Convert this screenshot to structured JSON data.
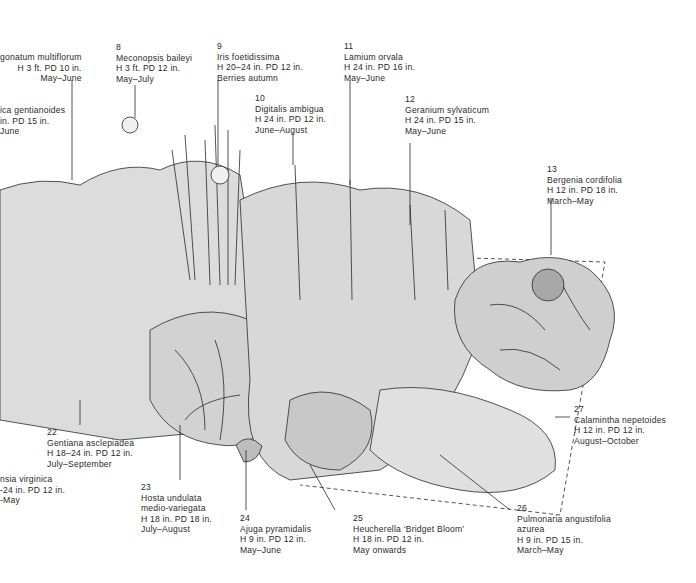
{
  "illustration": {
    "subject": "Mixed perennial border planting plan",
    "colors": {
      "ink": "#2a2a2a",
      "paper": "#ffffff",
      "leaf_fill": "#e4e4e4",
      "leaf_shade": "#bdbdbd"
    }
  },
  "labels": [
    {
      "id": "l-polygonatum",
      "num": "",
      "lines": [
        "gonatum multiflorum",
        "H 3 ft. PD 10 in.",
        "May–June"
      ]
    },
    {
      "id": "l-gentianoides",
      "num": "",
      "lines": [
        "ica gentianoides",
        "in. PD 15 in.",
        "June"
      ]
    },
    {
      "id": "l-8",
      "num": "8",
      "lines": [
        "Meconopsis baileyi",
        "H 3 ft. PD 12 in.",
        "May–July"
      ]
    },
    {
      "id": "l-9",
      "num": "9",
      "lines": [
        "Iris foetidissima",
        "H 20–24 in. PD 12 in.",
        "Berries autumn"
      ]
    },
    {
      "id": "l-10",
      "num": "10",
      "lines": [
        "Digitalis ambigua",
        "H 24 in. PD 12 in.",
        "June–August"
      ]
    },
    {
      "id": "l-11",
      "num": "11",
      "lines": [
        "Lamium orvala",
        "H 24 in. PD 16 in.",
        "May–June"
      ]
    },
    {
      "id": "l-12",
      "num": "12",
      "lines": [
        "Geranium sylvaticum",
        "H 24 in. PD 15 in.",
        "May–June"
      ]
    },
    {
      "id": "l-13",
      "num": "13",
      "lines": [
        "Bergenia cordifolia",
        "H 12 in. PD 18 in.",
        "March–May"
      ]
    },
    {
      "id": "l-22",
      "num": "22",
      "lines": [
        "Gentiana asclepiadea",
        "H 18–24 in. PD 12 in.",
        "July–September"
      ]
    },
    {
      "id": "l-virginica",
      "num": "",
      "lines": [
        "nsia virginica",
        "-24 in. PD 12 in.",
        "-May"
      ]
    },
    {
      "id": "l-23",
      "num": "23",
      "lines": [
        "Hosta undulata",
        "medio-variegata",
        "H 18 in. PD 18 in.",
        "July–August"
      ]
    },
    {
      "id": "l-24",
      "num": "24",
      "lines": [
        "Ajuga pyramidalis",
        "H 9 in. PD 12 in.",
        "May–June"
      ]
    },
    {
      "id": "l-25",
      "num": "25",
      "lines": [
        "Heucherella ‘Bridget Bloom’",
        "H 18 in. PD 12 in.",
        "May onwards"
      ]
    },
    {
      "id": "l-26",
      "num": "26",
      "lines": [
        "Pulmonaria angustifolia",
        "azurea",
        "H 9 in. PD 15 in.",
        "March–May"
      ]
    },
    {
      "id": "l-27",
      "num": "27",
      "lines": [
        "Calamintha nepetoides",
        "H 12 in. PD 12 in.",
        "August–October"
      ]
    }
  ]
}
